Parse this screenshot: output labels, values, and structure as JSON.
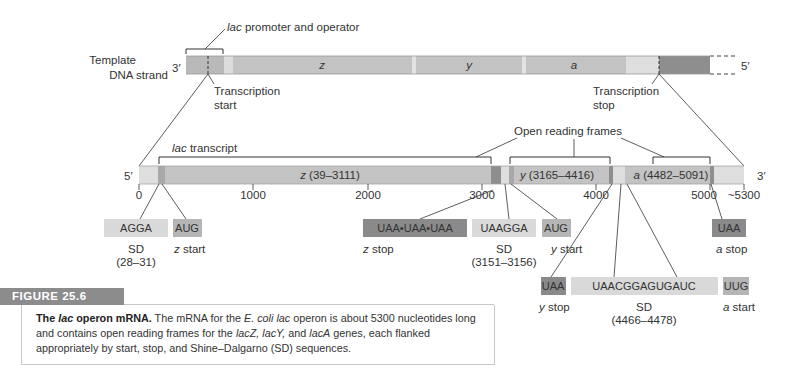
{
  "dna": {
    "label_line1": "Template",
    "label_line2": "DNA strand",
    "end_left": "3′",
    "end_right": "5′",
    "promoter_label_italic": "lac",
    "promoter_label_rest": " promoter and operator",
    "transcription_start_line1": "Transcription",
    "transcription_start_line2": "start",
    "transcription_stop_line1": "Transcription",
    "transcription_stop_line2": "stop",
    "genes": [
      "z",
      "y",
      "a"
    ]
  },
  "mrna": {
    "end_left": "5′",
    "end_right": "3′",
    "transcript_label_italic": "lac",
    "transcript_label_rest": " transcript",
    "orf_label": "Open reading frames",
    "genes": [
      {
        "name": "z",
        "range": " (39–3111)"
      },
      {
        "name": "y",
        "range": " (3165–4416)"
      },
      {
        "name": "a",
        "range": " (4482–5091)"
      }
    ],
    "ticks": [
      "0",
      "1000",
      "2000",
      "3000",
      "4000",
      "5000",
      "~5300"
    ]
  },
  "callouts": {
    "sd_z": {
      "seq": "AGGA",
      "label": "SD",
      "range": "(28–31)"
    },
    "z_start": {
      "seq": "AUG",
      "label_italic": "z",
      "label_rest": " start"
    },
    "z_stop": {
      "seq": "UAA•UAA•UAA",
      "label_italic": "z",
      "label_rest": " stop"
    },
    "sd_y": {
      "seq": "UAAGGA",
      "label": "SD",
      "range": "(3151–3156)"
    },
    "y_start": {
      "seq": "AUG",
      "label_italic": "y",
      "label_rest": " start"
    },
    "a_stop": {
      "seq": "UAA",
      "label_italic": "a",
      "label_rest": " stop"
    },
    "y_stop": {
      "seq": "UAA",
      "label_italic": "y",
      "label_rest": " stop"
    },
    "sd_a": {
      "seq": "UAACGGAGUGAUC",
      "label": "SD",
      "range": "(4466–4478)"
    },
    "a_start": {
      "seq": "UUG",
      "label_italic": "a",
      "label_rest": " start"
    }
  },
  "figure": {
    "tag": "FIGURE 25.6",
    "caption_title_1": "The ",
    "caption_title_italic": "lac",
    "caption_title_2": " operon mRNA.",
    "caption_p1": " The mRNA for the ",
    "caption_ecoli": "E. coli lac",
    "caption_p2": " operon is about 5300 nucleotides long and contains open reading frames for the ",
    "caption_lacz": "lacZ, lacY,",
    "caption_p3": " and ",
    "caption_laca": "lacA",
    "caption_p4": " genes, each flanked appropriately by start, stop, and Shine–Dalgarno (SD) sequences."
  },
  "colors": {
    "bar_mid": "#c3c3c3",
    "bar_light": "#dedede",
    "bar_dark": "#8e8e8e",
    "box_light": "#d9d9d9",
    "box_mid": "#b5b5b5",
    "box_dark": "#8a8a8a"
  }
}
